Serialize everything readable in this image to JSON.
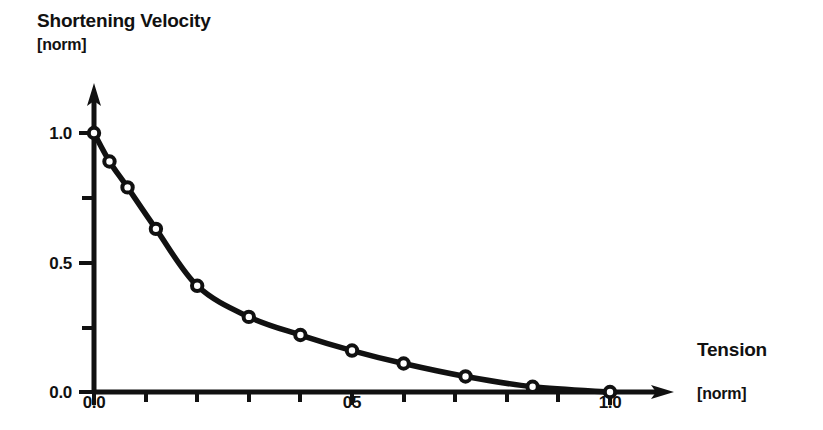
{
  "chart_data": {
    "type": "line",
    "title": "",
    "xlabel": "Tension",
    "xunit": "[norm]",
    "ylabel": "Shortening Velocity",
    "yunit": "[norm]",
    "xlim": [
      0.0,
      1.0
    ],
    "ylim": [
      0.0,
      1.0
    ],
    "grid": false,
    "legend": null,
    "marker": "open-circle",
    "line_color": "#111111",
    "marker_fill": "#ffffff",
    "x_major_ticks": [
      0.0,
      0.5,
      1.0
    ],
    "x_major_tick_labels": [
      "0.0",
      "05",
      "1.0"
    ],
    "x_minor_ticks": [
      0.1,
      0.2,
      0.3,
      0.4,
      0.6,
      0.7,
      0.8,
      0.9
    ],
    "y_major_ticks": [
      0.0,
      0.5,
      1.0
    ],
    "y_major_tick_labels": [
      "0.0",
      "0.5",
      "1.0"
    ],
    "y_minor_ticks": [
      0.25,
      0.75
    ],
    "x": [
      0.0,
      0.03,
      0.065,
      0.12,
      0.2,
      0.3,
      0.4,
      0.5,
      0.6,
      0.72,
      0.85,
      1.0
    ],
    "y": [
      1.0,
      0.89,
      0.79,
      0.63,
      0.41,
      0.29,
      0.22,
      0.16,
      0.11,
      0.06,
      0.02,
      0.0
    ],
    "points": [
      {
        "x": 0.0,
        "y": 1.0
      },
      {
        "x": 0.03,
        "y": 0.89
      },
      {
        "x": 0.065,
        "y": 0.79
      },
      {
        "x": 0.12,
        "y": 0.63
      },
      {
        "x": 0.2,
        "y": 0.41
      },
      {
        "x": 0.3,
        "y": 0.29
      },
      {
        "x": 0.4,
        "y": 0.22
      },
      {
        "x": 0.5,
        "y": 0.16
      },
      {
        "x": 0.6,
        "y": 0.11
      },
      {
        "x": 0.72,
        "y": 0.06
      },
      {
        "x": 0.85,
        "y": 0.02
      },
      {
        "x": 1.0,
        "y": 0.0
      }
    ]
  },
  "axes": {
    "y_axis_title": "Shortening Velocity",
    "y_axis_unit": "[norm]",
    "x_axis_title": "Tension",
    "x_axis_unit": "[norm]",
    "y_tick_labels": [
      "1.0",
      "0.5",
      "0.0"
    ],
    "x_tick_labels": [
      "0.0",
      "05",
      "1.0"
    ]
  },
  "colors": {
    "ink": "#111111",
    "background": "#ffffff",
    "marker_fill": "#ffffff"
  }
}
